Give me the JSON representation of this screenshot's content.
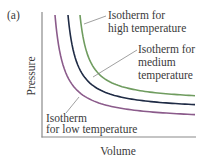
{
  "figure": {
    "panel_label": "(a)",
    "x_axis_label": "Volume",
    "y_axis_label": "Pressure",
    "colors": {
      "axis": "#8a8a8a",
      "low": "#8b5b8b",
      "medium": "#1f2b45",
      "high": "#6f9c5f",
      "leader": "#777777"
    },
    "isotherms": [
      {
        "id": "low",
        "label_lines": [
          "Isotherm",
          "for low temperature"
        ]
      },
      {
        "id": "medium",
        "label_lines": [
          "Isotherm for",
          "medium",
          "temperature"
        ]
      },
      {
        "id": "high",
        "label_lines": [
          "Isotherm for",
          "high temperature"
        ]
      }
    ]
  }
}
